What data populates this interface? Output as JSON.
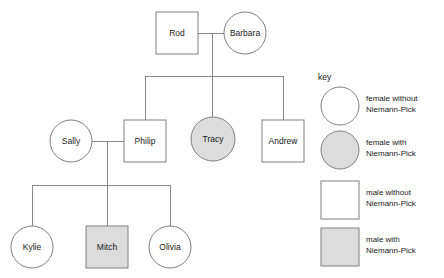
{
  "diagram": {
    "key_label": "key",
    "colors": {
      "affected_fill": "#dcdcdc",
      "unaffected_fill": "#ffffff",
      "shape_stroke": "#808080",
      "connector_stroke": "#8a8a8a",
      "text": "#1a1a1a",
      "background": "#ffffff"
    }
  },
  "people": [
    {
      "id": "rod",
      "name": "Rod",
      "sex": "male",
      "shape": "square",
      "affected": false,
      "generation": 1,
      "x": 156,
      "y": 12,
      "w": 42,
      "h": 42,
      "cx": 177,
      "cy": 33
    },
    {
      "id": "barbara",
      "name": "Barbara",
      "sex": "female",
      "shape": "circle",
      "affected": false,
      "generation": 1,
      "cx": 245,
      "cy": 33,
      "r": 21
    },
    {
      "id": "sally",
      "name": "Sally",
      "sex": "female",
      "shape": "circle",
      "affected": false,
      "generation": 2,
      "cx": 71,
      "cy": 141,
      "r": 21
    },
    {
      "id": "philip",
      "name": "Philip",
      "sex": "male",
      "shape": "square",
      "affected": false,
      "generation": 2,
      "x": 124,
      "y": 120,
      "w": 42,
      "h": 42,
      "cx": 145,
      "cy": 141
    },
    {
      "id": "tracy",
      "name": "Tracy",
      "sex": "female",
      "shape": "circle",
      "affected": true,
      "generation": 2,
      "cx": 213,
      "cy": 139,
      "r": 22
    },
    {
      "id": "andrew",
      "name": "Andrew",
      "sex": "male",
      "shape": "square",
      "affected": false,
      "generation": 2,
      "x": 262,
      "y": 120,
      "w": 42,
      "h": 42,
      "cx": 283,
      "cy": 141
    },
    {
      "id": "kylie",
      "name": "Kylie",
      "sex": "female",
      "shape": "circle",
      "affected": false,
      "generation": 3,
      "cx": 32,
      "cy": 247,
      "r": 21
    },
    {
      "id": "mitch",
      "name": "Mitch",
      "sex": "male",
      "shape": "square",
      "affected": true,
      "generation": 3,
      "x": 86,
      "y": 226,
      "w": 42,
      "h": 42,
      "cx": 107,
      "cy": 247
    },
    {
      "id": "olivia",
      "name": "Olivia",
      "sex": "female",
      "shape": "circle",
      "affected": false,
      "generation": 3,
      "cx": 170,
      "cy": 247,
      "r": 21
    }
  ],
  "connectors": [
    {
      "id": "marriage-rod-barbara",
      "type": "marriage",
      "points": "198,33 224,33"
    },
    {
      "id": "descent-gen1",
      "type": "descent",
      "points": "212,33 212,76"
    },
    {
      "id": "sibship-gen2",
      "type": "sibship",
      "points": "145,76 283,76"
    },
    {
      "id": "drop-philip",
      "type": "drop",
      "points": "145,76 145,120"
    },
    {
      "id": "drop-tracy",
      "type": "drop",
      "points": "212,76 212,117"
    },
    {
      "id": "drop-andrew",
      "type": "drop",
      "points": "283,76 283,120"
    },
    {
      "id": "marriage-sally-philip",
      "type": "marriage",
      "points": "92,141 124,141"
    },
    {
      "id": "descent-gen2",
      "type": "descent",
      "points": "107,141 107,185"
    },
    {
      "id": "sibship-gen3",
      "type": "sibship",
      "points": "32,185 170,185"
    },
    {
      "id": "drop-kylie",
      "type": "drop",
      "points": "32,185 32,226"
    },
    {
      "id": "drop-mitch",
      "type": "drop",
      "points": "107,185 107,226"
    },
    {
      "id": "drop-olivia",
      "type": "drop",
      "points": "170,185 170,226"
    }
  ],
  "key": {
    "label": "key",
    "label_x": 318,
    "label_y": 80,
    "items": [
      {
        "id": "legend-female-unaffected",
        "shape": "circle",
        "affected": false,
        "cx": 340,
        "cy": 106,
        "r": 19,
        "line1": "female without",
        "line2": "Niemann-Pick",
        "text_x": 366,
        "text_y1": 101,
        "text_y2": 112
      },
      {
        "id": "legend-female-affected",
        "shape": "circle",
        "affected": true,
        "cx": 340,
        "cy": 150,
        "r": 19,
        "line1": "female with",
        "line2": "Niemann-Pick",
        "text_x": 366,
        "text_y1": 145,
        "text_y2": 156
      },
      {
        "id": "legend-male-unaffected",
        "shape": "square",
        "affected": false,
        "x": 321,
        "y": 181,
        "w": 38,
        "h": 38,
        "line1": "male without",
        "line2": "Niemann-Pick",
        "text_x": 366,
        "text_y1": 195,
        "text_y2": 206
      },
      {
        "id": "legend-male-affected",
        "shape": "square",
        "affected": true,
        "x": 321,
        "y": 228,
        "w": 38,
        "h": 38,
        "line1": "male with",
        "line2": "Niemann-Pick",
        "text_x": 366,
        "text_y1": 242,
        "text_y2": 253
      }
    ]
  }
}
